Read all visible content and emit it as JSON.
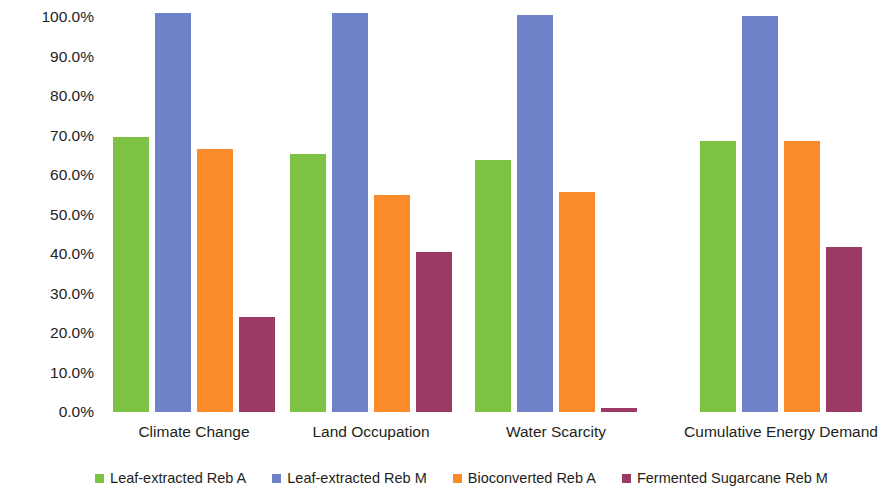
{
  "chart_data": {
    "type": "bar",
    "title": "",
    "xlabel": "",
    "ylabel": "Relative Impact Score",
    "ylim": [
      0,
      100
    ],
    "ytick_labels": [
      "100.0%",
      "90.0%",
      "80.0%",
      "70.0%",
      "60.0%",
      "50.0%",
      "40.0%",
      "30.0%",
      "20.0%",
      "10.0%",
      "0.0%"
    ],
    "ytick_values": [
      100,
      90,
      80,
      70,
      60,
      50,
      40,
      30,
      20,
      10,
      0
    ],
    "grid": false,
    "legend_position": "bottom",
    "categories": [
      "Climate Change",
      "Land Occupation",
      "Water Scarcity",
      "Cumulative Energy Demand"
    ],
    "series": [
      {
        "name": "Leaf-extracted Reb A",
        "color": "#7DC242",
        "values": [
          69.7,
          65.2,
          63.9,
          68.7
        ]
      },
      {
        "name": "Leaf-extracted Reb M",
        "color": "#6F82C9",
        "values": [
          101.0,
          101.0,
          100.6,
          100.3
        ]
      },
      {
        "name": "Bioconverted Reb A",
        "color": "#F98B2B",
        "values": [
          66.6,
          55.0,
          55.8,
          68.5
        ]
      },
      {
        "name": "Fermented Sugarcane Reb M",
        "color": "#9B3A62",
        "values": [
          24.0,
          40.5,
          1.0,
          41.9
        ]
      }
    ]
  },
  "legend": {
    "items": [
      {
        "label": "Leaf-extracted Reb A",
        "color": "#7DC242"
      },
      {
        "label": "Leaf-extracted Reb M",
        "color": "#6F82C9"
      },
      {
        "label": "Bioconverted Reb A",
        "color": "#F98B2B"
      },
      {
        "label": "Fermented Sugarcane Reb M",
        "color": "#9B3A62"
      }
    ]
  }
}
